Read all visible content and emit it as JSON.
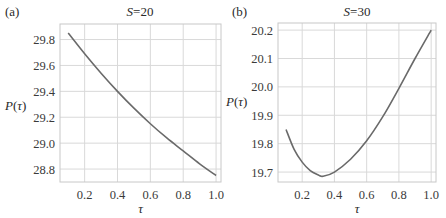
{
  "chart_data": [
    {
      "type": "line",
      "panel_label": "(a)",
      "title_var": "S",
      "title_val": "=20",
      "xlabel": "τ",
      "ylabel": "P(τ)",
      "xlim": [
        0.05,
        1.03
      ],
      "ylim": [
        28.7,
        29.92
      ],
      "xticks": [
        0.2,
        0.4,
        0.6,
        0.8,
        1.0
      ],
      "xtick_labels": [
        "0.2",
        "0.4",
        "0.6",
        "0.8",
        "1.0"
      ],
      "yticks": [
        28.8,
        29.0,
        29.2,
        29.4,
        29.6,
        29.8
      ],
      "ytick_labels": [
        "28.8",
        "29.0",
        "29.2",
        "29.4",
        "29.6",
        "29.8"
      ],
      "grid": true,
      "series": [
        {
          "name": "P(τ), S=20",
          "x": [
            0.1,
            0.2,
            0.3,
            0.4,
            0.5,
            0.6,
            0.7,
            0.8,
            0.9,
            1.0
          ],
          "y": [
            29.85,
            29.69,
            29.54,
            29.4,
            29.27,
            29.15,
            29.04,
            28.94,
            28.84,
            28.75
          ]
        }
      ]
    },
    {
      "type": "line",
      "panel_label": "(b)",
      "title_var": "S",
      "title_val": "=30",
      "xlabel": "τ",
      "ylabel": "P(τ)",
      "xlim": [
        0.05,
        1.03
      ],
      "ylim": [
        19.665,
        20.225
      ],
      "xticks": [
        0.2,
        0.4,
        0.6,
        0.8,
        1.0
      ],
      "xtick_labels": [
        "0.2",
        "0.4",
        "0.6",
        "0.8",
        "1.0"
      ],
      "yticks": [
        19.7,
        19.8,
        19.9,
        20.0,
        20.1,
        20.2
      ],
      "ytick_labels": [
        "19.7",
        "19.8",
        "19.9",
        "20.0",
        "20.1",
        "20.2"
      ],
      "grid": true,
      "series": [
        {
          "name": "P(τ), S=30",
          "x": [
            0.1,
            0.15,
            0.2,
            0.25,
            0.3,
            0.33,
            0.4,
            0.5,
            0.6,
            0.7,
            0.8,
            0.9,
            1.0
          ],
          "y": [
            19.85,
            19.78,
            19.735,
            19.705,
            19.69,
            19.685,
            19.7,
            19.745,
            19.81,
            19.895,
            19.995,
            20.1,
            20.2
          ]
        }
      ]
    }
  ]
}
